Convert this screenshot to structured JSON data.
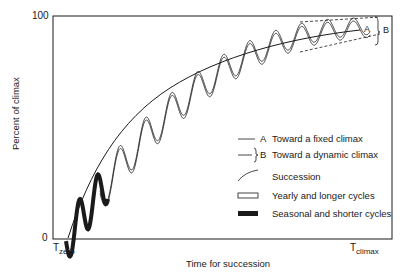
{
  "diagram": {
    "y_axis": {
      "label": "Percent of climax",
      "tick_top": "100",
      "tick_bottom": "0"
    },
    "x_axis": {
      "label": "Time for succession",
      "start": {
        "main": "T",
        "sub": "zero"
      },
      "end": {
        "main": "T",
        "sub": "climax"
      }
    },
    "annotations": {
      "a": "A",
      "b": "B"
    },
    "legend": [
      {
        "key": "A",
        "label": "Toward a fixed climax",
        "icon": "thin-line"
      },
      {
        "key": "B",
        "label": "Toward a dynamic climax",
        "icon": "line-with-brace"
      },
      {
        "key": "",
        "label": "Succession",
        "icon": "curve"
      },
      {
        "key": "",
        "label": "Yearly and longer cycles",
        "icon": "open-bar"
      },
      {
        "key": "",
        "label": "Seasonal and shorter cycles",
        "icon": "filled-bar"
      }
    ],
    "colors": {
      "ink": "#1a1a1a",
      "background": "#ffffff"
    }
  }
}
